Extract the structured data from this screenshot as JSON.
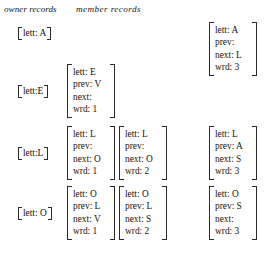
{
  "figure": {
    "headers": {
      "owner": "owner records",
      "member": "member records"
    },
    "rows": [
      {
        "key": "A",
        "owner": "[lett: A]",
        "owner_label": "lett: A",
        "members": [
          {
            "slot": "m4",
            "lett": "lett: A",
            "prev": "prev:",
            "next": "next: L",
            "wrd": "wrd: 3"
          }
        ]
      },
      {
        "key": "E",
        "owner": "[lett:E]",
        "owner_label": "lett:E",
        "members": [
          {
            "slot": "m1",
            "lett": "lett: E",
            "prev": "prev: V",
            "next": "next:",
            "wrd": "wrd: 1"
          }
        ]
      },
      {
        "key": "L",
        "owner": "[lett:L]",
        "owner_label": "lett:L",
        "members": [
          {
            "slot": "m1",
            "lett": "lett: L",
            "prev": "prev:",
            "next": "next: O",
            "wrd": "wrd: 1"
          },
          {
            "slot": "m2",
            "lett": "lett: L",
            "prev": "prev:",
            "next": "next: O",
            "wrd": "wrd: 2"
          },
          {
            "slot": "m4",
            "lett": "lett: L",
            "prev": "prev: A",
            "next": "next: S",
            "wrd": "wrd: 3"
          }
        ]
      },
      {
        "key": "O",
        "owner": "[lett: O]",
        "owner_label": "lett: O",
        "members": [
          {
            "slot": "m1",
            "lett": "lett: O",
            "prev": "prev: L",
            "next": "next: V",
            "wrd": "wrd: 1"
          },
          {
            "slot": "m2",
            "lett": "lett: O",
            "prev": "prev: L",
            "next": "next: S",
            "wrd": "wrd: 2"
          },
          {
            "slot": "m4",
            "lett": "lett: O",
            "prev": "prev: S",
            "next": "next:",
            "wrd": "wrd: 3"
          }
        ]
      }
    ]
  }
}
